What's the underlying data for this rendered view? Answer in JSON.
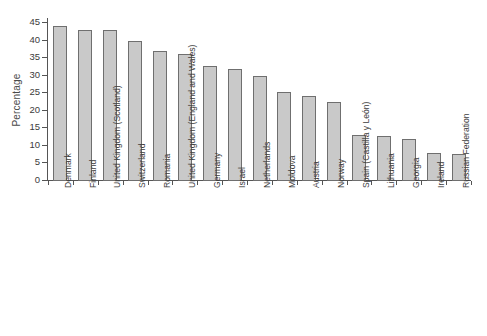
{
  "chart_data": {
    "type": "bar",
    "title": "",
    "subtitle": "",
    "xlabel": "",
    "ylabel": "Percentage",
    "ylim": [
      0,
      45
    ],
    "ytick_labels": [
      "0",
      "5",
      "10",
      "15",
      "20",
      "25",
      "30",
      "35",
      "40",
      "45"
    ],
    "ytick_values": [
      0,
      5,
      10,
      15,
      20,
      25,
      30,
      35,
      40,
      45
    ],
    "grid": false,
    "legend": false,
    "orientation": "vertical",
    "bar_fill_color": "#c9c9c9",
    "bar_border_color": "#6f6f6f",
    "axis_color": "#555555",
    "categories": [
      "Denmark",
      "Finland",
      "United Kingdom (Scotland)",
      "Switzerland",
      "Romania",
      "United Kingdom (England and Wales)",
      "Germany",
      "Israel",
      "Netherlands",
      "Moldova",
      "Austria",
      "Norway",
      "Spain (Castilla y León)",
      "Lithuania",
      "Georgia",
      "Ireland",
      "Russian Federation"
    ],
    "values": [
      44.0,
      42.6,
      42.6,
      39.7,
      36.6,
      35.8,
      32.4,
      31.7,
      29.6,
      25.1,
      23.8,
      22.1,
      12.8,
      12.4,
      11.7,
      7.8,
      7.5
    ]
  }
}
